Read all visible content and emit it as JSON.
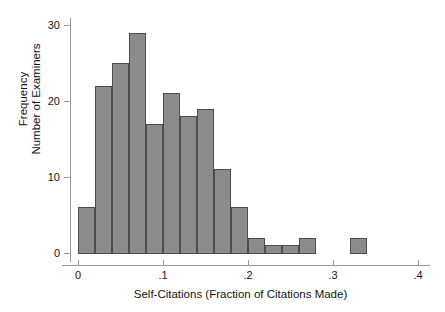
{
  "chart_data": {
    "type": "bar",
    "title": "",
    "subtitle": "",
    "xlabel": "Self-Citations (Fraction of Citations Made)",
    "ylabel": "Frequency\nNumber of Examiners",
    "ylabel_lines": [
      "Frequency",
      "Number of Examiners"
    ],
    "xlim": [
      0,
      0.4
    ],
    "ylim": [
      0,
      30
    ],
    "grid": false,
    "legend": "none",
    "bin_width": 0.02,
    "x_ticks": [
      0,
      0.1,
      0.2,
      0.3,
      0.4
    ],
    "x_tick_labels": [
      "0",
      ".1",
      ".2",
      ".3",
      ".4"
    ],
    "y_ticks": [
      0,
      10,
      20,
      30
    ],
    "y_tick_labels": [
      "0",
      "10",
      "20",
      "30"
    ],
    "bar_fill_color": "#8b8b8b",
    "bar_border_color": "#4d4d4d",
    "axis_color": "#999a9a",
    "background_color": "#ffffff",
    "bins": [
      {
        "x0": 0.0,
        "x1": 0.02,
        "value": 6
      },
      {
        "x0": 0.02,
        "x1": 0.04,
        "value": 22
      },
      {
        "x0": 0.04,
        "x1": 0.06,
        "value": 25
      },
      {
        "x0": 0.06,
        "x1": 0.08,
        "value": 29
      },
      {
        "x0": 0.08,
        "x1": 0.1,
        "value": 17
      },
      {
        "x0": 0.1,
        "x1": 0.12,
        "value": 21
      },
      {
        "x0": 0.12,
        "x1": 0.14,
        "value": 18
      },
      {
        "x0": 0.14,
        "x1": 0.16,
        "value": 19
      },
      {
        "x0": 0.16,
        "x1": 0.18,
        "value": 11
      },
      {
        "x0": 0.18,
        "x1": 0.2,
        "value": 6
      },
      {
        "x0": 0.2,
        "x1": 0.22,
        "value": 2
      },
      {
        "x0": 0.22,
        "x1": 0.24,
        "value": 1
      },
      {
        "x0": 0.24,
        "x1": 0.26,
        "value": 1
      },
      {
        "x0": 0.26,
        "x1": 0.28,
        "value": 2
      },
      {
        "x0": 0.28,
        "x1": 0.3,
        "value": 0
      },
      {
        "x0": 0.3,
        "x1": 0.32,
        "value": 0
      },
      {
        "x0": 0.32,
        "x1": 0.34,
        "value": 2
      },
      {
        "x0": 0.34,
        "x1": 0.36,
        "value": 0
      },
      {
        "x0": 0.36,
        "x1": 0.38,
        "value": 0
      },
      {
        "x0": 0.38,
        "x1": 0.4,
        "value": 0
      }
    ],
    "categories": [
      "0.00-0.02",
      "0.02-0.04",
      "0.04-0.06",
      "0.06-0.08",
      "0.08-0.10",
      "0.10-0.12",
      "0.12-0.14",
      "0.14-0.16",
      "0.16-0.18",
      "0.18-0.20",
      "0.20-0.22",
      "0.22-0.24",
      "0.24-0.26",
      "0.26-0.28",
      "0.28-0.30",
      "0.30-0.32",
      "0.32-0.34",
      "0.34-0.36",
      "0.36-0.38",
      "0.38-0.40"
    ],
    "values": [
      6,
      22,
      25,
      29,
      17,
      21,
      18,
      19,
      11,
      6,
      2,
      1,
      1,
      2,
      0,
      0,
      2,
      0,
      0,
      0
    ]
  }
}
